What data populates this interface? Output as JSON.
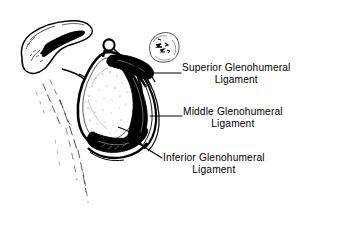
{
  "figure": {
    "type": "anatomical-line-drawing",
    "ink_color": "#000000",
    "background_color": "#ffffff"
  },
  "labels": {
    "superior": {
      "line1": "Superior Glenohumeral",
      "line2": "Ligament"
    },
    "middle": {
      "line1": "Middle Glenohumeral",
      "line2": "Ligament"
    },
    "inferior": {
      "line1": "Inferior Glenohumeral",
      "line2": "Ligament"
    }
  },
  "anatomy": {
    "acromion": "acromion and scapular spine",
    "glenoid_fossa": "glenoid fossa",
    "supraglenoid_tubercle": "supraglenoid tubercle",
    "coracoid_process": "coracoid process",
    "lateral_border": "lateral border of scapula"
  }
}
